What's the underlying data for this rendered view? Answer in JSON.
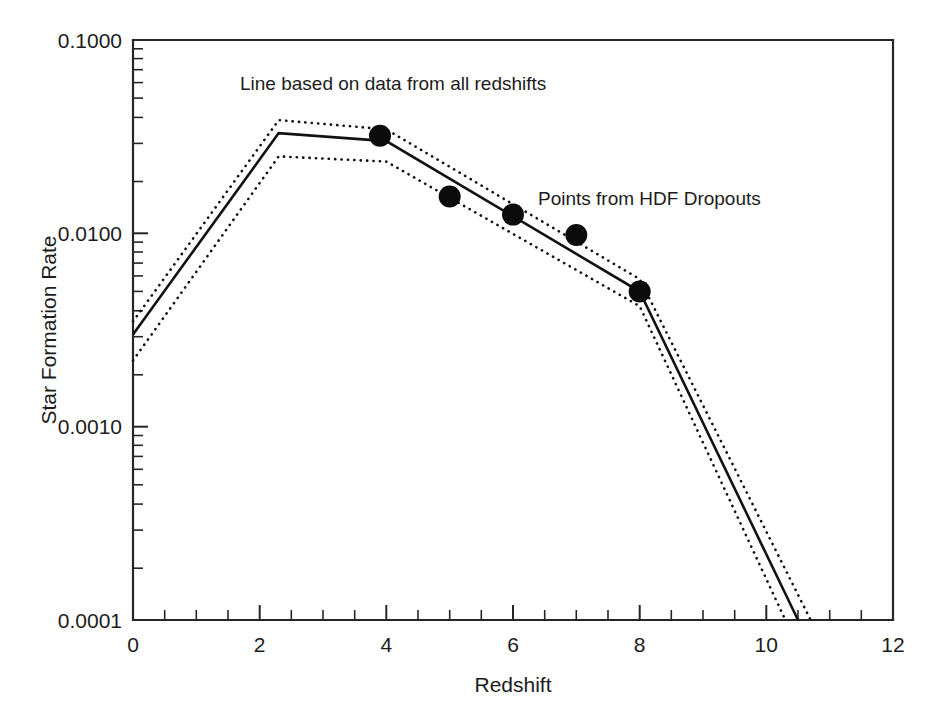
{
  "chart_data": {
    "type": "line",
    "title": "",
    "xlabel": "Redshift",
    "ylabel": "Star Formation Rate",
    "xlim": [
      0,
      12
    ],
    "ylim": [
      0.0001,
      0.1
    ],
    "yscale": "log",
    "xscale": "linear",
    "grid": false,
    "legend": "none",
    "xticks": [
      0,
      2,
      4,
      6,
      8,
      10,
      12
    ],
    "xtick_labels": [
      "0",
      "2",
      "4",
      "6",
      "8",
      "10",
      "12"
    ],
    "xtick_minor_step": 0.5,
    "yticks": [
      0.0001,
      0.001,
      0.01,
      0.1
    ],
    "ytick_labels": [
      "0.0001",
      "0.0010",
      "0.0100",
      "0.1000"
    ],
    "ytick_minor": "log-decade-multiples-2-to-9",
    "series": [
      {
        "name": "Star formation rate (best fit)",
        "style": "solid",
        "x": [
          0,
          2.3,
          4,
          8,
          10.5
        ],
        "values": [
          0.003,
          0.033,
          0.03,
          0.005,
          0.0001
        ]
      },
      {
        "name": "Upper confidence bound",
        "style": "dotted",
        "x": [
          0,
          2.3,
          4,
          8,
          10.7
        ],
        "values": [
          0.0035,
          0.0385,
          0.0345,
          0.0058,
          0.0001
        ]
      },
      {
        "name": "Lower confidence bound",
        "style": "dotted",
        "x": [
          0,
          2.3,
          4,
          8,
          10.3
        ],
        "values": [
          0.0022,
          0.025,
          0.0235,
          0.0042,
          0.0001
        ]
      }
    ],
    "points": {
      "name": "Points from HDF Dropouts",
      "marker": "filled-circle",
      "x": [
        3.9,
        5.0,
        6.0,
        7.0,
        8.0
      ],
      "values": [
        0.032,
        0.0155,
        0.0125,
        0.0098,
        0.005
      ]
    },
    "annotations": [
      {
        "name": "line-annotation",
        "text": "Line based on data from all redshifts",
        "x_px": 240,
        "y_px": 90
      },
      {
        "name": "points-annotation",
        "text": "Points from HDF Dropouts",
        "x_px": 538,
        "y_px": 205
      }
    ]
  },
  "axes": {
    "x_title": "Redshift",
    "y_title": "Star Formation Rate",
    "x_labels": [
      "0",
      "2",
      "4",
      "6",
      "8",
      "10",
      "12"
    ],
    "y_labels": [
      "0.1000",
      "0.0100",
      "0.0010",
      "0.0001"
    ]
  },
  "annotations": {
    "line_note": "Line based on data from all redshifts",
    "points_note": "Points from HDF Dropouts"
  },
  "colors": {
    "ink": "#121212",
    "background": "#ffffff",
    "marker": "#0b0b0b"
  }
}
